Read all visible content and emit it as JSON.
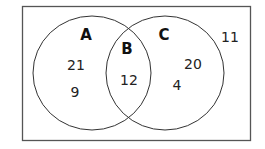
{
  "diagram": {
    "type": "venn",
    "sets": [
      {
        "label": "A",
        "color": "#333333"
      },
      {
        "label": "C",
        "color": "#333333"
      }
    ],
    "intersection_label": "B",
    "regions": {
      "a_only": [
        "21",
        "9"
      ],
      "intersection": [
        "12"
      ],
      "c_only": [
        "20",
        "4"
      ],
      "outside": [
        "11"
      ]
    },
    "colors": {
      "border": "#555555",
      "circle": "#333333",
      "background": "#ffffff"
    }
  }
}
